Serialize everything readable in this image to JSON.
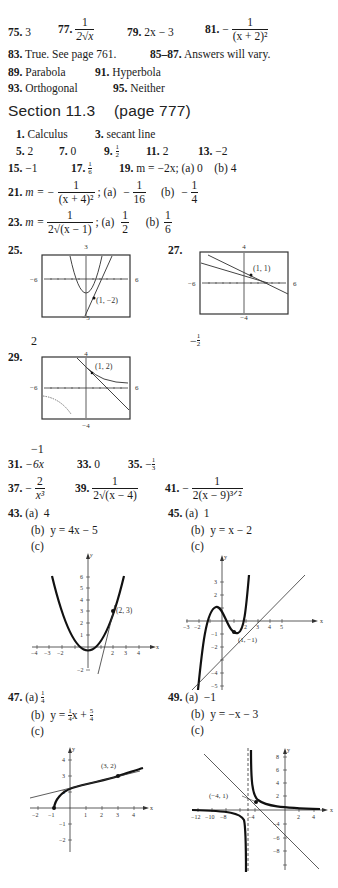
{
  "top_answers": {
    "a75": {
      "num": "75.",
      "value": "3"
    },
    "a77": {
      "num": "77.",
      "numerator": "1",
      "denominator": "2√x"
    },
    "a79": {
      "num": "79.",
      "value": "2x − 3"
    },
    "a81": {
      "num": "81.",
      "sign": "−",
      "numerator": "1",
      "denominator": "(x + 2)²"
    },
    "a83": {
      "num": "83.",
      "value": "True. See page 761."
    },
    "a85": {
      "num": "85–87.",
      "value": "Answers will vary."
    },
    "a89": {
      "num": "89.",
      "value": "Parabola"
    },
    "a91": {
      "num": "91.",
      "value": "Hyperbola"
    },
    "a93": {
      "num": "93.",
      "value": "Orthogonal"
    },
    "a95": {
      "num": "95.",
      "value": "Neither"
    }
  },
  "section": {
    "title": "Section 11.3",
    "page": "(page 777)"
  },
  "answers": {
    "a1": {
      "num": "1.",
      "value": "Calculus"
    },
    "a3": {
      "num": "3.",
      "value": "secant line"
    },
    "a5": {
      "num": "5.",
      "value": "2"
    },
    "a7": {
      "num": "7.",
      "value": "0"
    },
    "a9": {
      "num": "9.",
      "n": "1",
      "d": "2"
    },
    "a11": {
      "num": "11.",
      "value": "2"
    },
    "a13": {
      "num": "13.",
      "value": "−2"
    },
    "a15": {
      "num": "15.",
      "value": "−1"
    },
    "a17": {
      "num": "17.",
      "n": "1",
      "d": "6"
    },
    "a19": {
      "num": "19.",
      "value": "m = −2x; (a) 0    (b) 4"
    },
    "a21": {
      "num": "21.",
      "prefix": "m = −",
      "numerator": "1",
      "denominator": "(x + 4)²",
      "a_label": "; (a)",
      "a_sign": "−",
      "a_n": "1",
      "a_d": "16",
      "b_label": "(b)",
      "b_sign": "−",
      "b_n": "1",
      "b_d": "4"
    },
    "a23": {
      "num": "23.",
      "prefix": "m =",
      "numerator": "1",
      "denominator": "2√(x − 1)",
      "a_label": "; (a)",
      "a_n": "1",
      "a_d": "2",
      "b_label": "(b)",
      "b_n": "1",
      "b_d": "6"
    },
    "a25": {
      "num": "25.",
      "window": {
        "top": "3",
        "bottom": "−5",
        "left": "−6",
        "right": "6"
      },
      "point": "(1, −2)",
      "below": "2"
    },
    "a27": {
      "num": "27.",
      "window": {
        "top": "4",
        "bottom": "−4",
        "left": "−6",
        "right": "6"
      },
      "point": "(1, 1)",
      "below_sign": "−",
      "below_n": "1",
      "below_d": "2"
    },
    "a29": {
      "num": "29.",
      "window": {
        "top": "4",
        "bottom": "−4",
        "left": "−6",
        "right": "6"
      },
      "point": "(1, 2)",
      "below": "−1"
    },
    "a31": {
      "num": "31.",
      "value": "−6x"
    },
    "a33": {
      "num": "33.",
      "value": "0"
    },
    "a35": {
      "num": "35.",
      "sign": "−",
      "n": "1",
      "d": "3"
    },
    "a37": {
      "num": "37.",
      "sign": "−",
      "numerator": "2",
      "denominator": "x³"
    },
    "a39": {
      "num": "39.",
      "numerator": "1",
      "denominator": "2√(x − 4)"
    },
    "a41": {
      "num": "41.",
      "sign": "−",
      "numerator": "1",
      "denominator": "2(x − 9)³ᐟ²"
    },
    "a43": {
      "num": "43.",
      "a": "(a)  4",
      "b": "(b)  y = 4x − 5",
      "c": "(c)",
      "point": "(2, 3)",
      "xticks": [
        "−4",
        "−3",
        "−2",
        "2",
        "3",
        "4"
      ],
      "yticks": [
        "1",
        "2",
        "3",
        "4",
        "5",
        "6",
        "−2"
      ]
    },
    "a45": {
      "num": "45.",
      "a": "(a)  1",
      "b": "(b)  y = x − 2",
      "c": "(c)",
      "point": "(1, −1)",
      "xticks": [
        "−3",
        "−2",
        "2",
        "3",
        "4",
        "5"
      ],
      "yticks": [
        "3",
        "2",
        "−1",
        "−2",
        "−4",
        "−5"
      ]
    },
    "a47": {
      "num": "47.",
      "a_label": "(a)",
      "a_n": "1",
      "a_d": "4",
      "b_label": "(b)  y =",
      "b_n1": "1",
      "b_d1": "4",
      "b_mid": "x +",
      "b_n2": "5",
      "b_d2": "4",
      "c": "(c)",
      "point": "(3, 2)",
      "xticks": [
        "−2",
        "−1",
        "1",
        "2",
        "3",
        "4"
      ],
      "yticks": [
        "4",
        "3",
        "2",
        "−1",
        "−2"
      ]
    },
    "a49": {
      "num": "49.",
      "a": "(a)  −1",
      "b": "(b)  y = −x − 3",
      "c": "(c)",
      "point": "(−4, 1)",
      "xticks": [
        "−12",
        "−10",
        "−8",
        "−4",
        "2",
        "4"
      ],
      "yticks": [
        "8",
        "6",
        "4",
        "2",
        "−4",
        "−6",
        "−8"
      ]
    }
  },
  "axis_labels": {
    "x": "x",
    "y": "y"
  }
}
